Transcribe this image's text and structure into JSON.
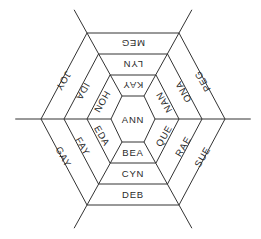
{
  "diagram": {
    "type": "hexagonal-word-web",
    "center": {
      "x": 133,
      "y": 119
    },
    "stroke_color": "#333333",
    "rings": [
      {
        "rx": 22,
        "ry": 23
      },
      {
        "rx": 46,
        "ry": 44
      },
      {
        "rx": 69,
        "ry": 65
      },
      {
        "rx": 92,
        "ry": 86
      }
    ],
    "center_label": "ANN",
    "ring1": [
      "KAY",
      "NAN",
      "QUE",
      "BEA",
      "EDA",
      "HON"
    ],
    "ring2": [
      "LYN",
      "ONA",
      "RAE",
      "CYN",
      "FAY",
      "IDA"
    ],
    "ring3": [
      "MEG",
      "PEG",
      "SUE",
      "DEB",
      "GAY",
      "JOY"
    ]
  }
}
